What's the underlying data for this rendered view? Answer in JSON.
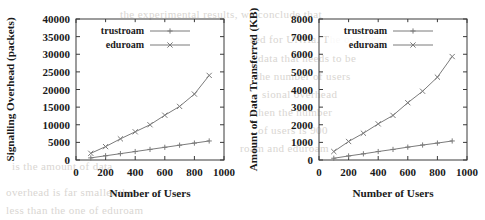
{
  "figure": {
    "background_color": "#ffffff",
    "line_color": "#7b7b7b",
    "axis_color": "#3a3a3a",
    "artifact_color": "#d9d6d2"
  },
  "scan_artifacts": [
    {
      "text": "the experimental results, we conclude that",
      "x": 120,
      "y": 8
    },
    {
      "text": "sed for UNHa. The overhead",
      "x": 250,
      "y": 33
    },
    {
      "text": "data that needs to be",
      "x": 258,
      "y": 52
    },
    {
      "text": "the number of users",
      "x": 256,
      "y": 70
    },
    {
      "text": "sional overhead",
      "x": 262,
      "y": 88
    },
    {
      "text": "when the number",
      "x": 250,
      "y": 106
    },
    {
      "text": "of users is 900",
      "x": 258,
      "y": 124
    },
    {
      "text": "roam and eduroam",
      "x": 240,
      "y": 142
    },
    {
      "text": "is the amount of data",
      "x": 12,
      "y": 160
    },
    {
      "text": "overhead is far smaller than",
      "x": 6,
      "y": 186
    },
    {
      "text": "less than the one of eduroam",
      "x": 6,
      "y": 204
    }
  ],
  "charts": [
    {
      "name": "signalling-overhead-chart",
      "chart_id": "left",
      "chart_data": {
        "type": "line",
        "title": "",
        "xlabel": "Number of Users",
        "ylabel": "Signalling Overhead (packets)",
        "x": [
          100,
          200,
          300,
          400,
          500,
          600,
          700,
          800,
          900
        ],
        "xlim": [
          0,
          1000
        ],
        "ylim": [
          0,
          40000
        ],
        "xticks": [
          0,
          200,
          400,
          600,
          800,
          1000
        ],
        "yticks": [
          0,
          5000,
          10000,
          15000,
          20000,
          25000,
          30000,
          35000,
          40000
        ],
        "xtick_labels": [
          "0",
          "200",
          "400",
          "600",
          "800",
          "1000"
        ],
        "ytick_labels": [
          "0",
          "5000",
          "10000",
          "15000",
          "20000",
          "25000",
          "30000",
          "35000",
          "40000"
        ],
        "grid": false,
        "legend_position": "top-left-inside",
        "series": [
          {
            "name": "trustroam",
            "marker": "plus",
            "values": [
              600,
              1200,
              1800,
              2400,
              3000,
              3600,
              4200,
              4800,
              5400
            ]
          },
          {
            "name": "eduroam",
            "marker": "cross",
            "values": [
              1900,
              3800,
              6000,
              8000,
              10000,
              12700,
              15200,
              18700,
              24000
            ]
          }
        ]
      }
    },
    {
      "name": "data-transferred-chart",
      "chart_id": "right",
      "chart_data": {
        "type": "line",
        "title": "",
        "xlabel": "Number of Users",
        "ylabel": "Amount of Data Transferred (KB)",
        "x": [
          100,
          200,
          300,
          400,
          500,
          600,
          700,
          800,
          900
        ],
        "xlim": [
          0,
          1000
        ],
        "ylim": [
          0,
          8000
        ],
        "xticks": [
          0,
          200,
          400,
          600,
          800,
          1000
        ],
        "yticks": [
          0,
          1000,
          2000,
          3000,
          4000,
          5000,
          6000,
          7000,
          8000
        ],
        "xtick_labels": [
          "0",
          "200",
          "400",
          "600",
          "800",
          "1000"
        ],
        "ytick_labels": [
          "0",
          "1000",
          "2000",
          "3000",
          "4000",
          "5000",
          "6000",
          "7000",
          "8000"
        ],
        "grid": false,
        "legend_position": "top-left-inside",
        "series": [
          {
            "name": "trustroam",
            "marker": "plus",
            "values": [
              100,
              230,
              350,
              480,
              600,
              730,
              850,
              960,
              1080
            ]
          },
          {
            "name": "eduroam",
            "marker": "cross",
            "values": [
              480,
              1050,
              1520,
              2050,
              2530,
              3250,
              3900,
              4700,
              5870
            ]
          }
        ]
      }
    }
  ]
}
